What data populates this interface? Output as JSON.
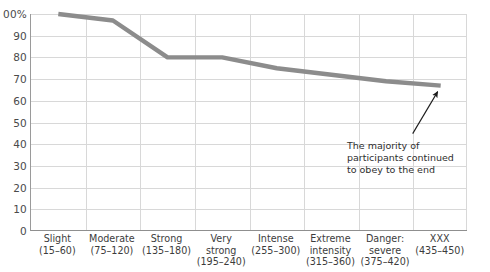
{
  "chart_data": {
    "type": "line",
    "title": "",
    "xlabel": "",
    "ylabel": "",
    "ylim": [
      0,
      100
    ],
    "grid": true,
    "legend": "none",
    "y_unit": "%",
    "y_ticks": [
      "100%",
      "90",
      "80",
      "70",
      "60",
      "50",
      "40",
      "30",
      "20",
      "10",
      "0"
    ],
    "y_tick_values": [
      100,
      90,
      80,
      70,
      60,
      50,
      40,
      30,
      20,
      10,
      0
    ],
    "y_top_label_clipped_text": "00%",
    "categories": [
      "Slight",
      "Moderate",
      "Strong",
      "Very strong",
      "Intense",
      "Extreme intensity",
      "Danger: severe",
      "XXX"
    ],
    "category_ranges": [
      "(15–60)",
      "(75–120)",
      "(135–180)",
      "(195–240)",
      "(255–300)",
      "(315–360)",
      "(375–420)",
      "(435–450)"
    ],
    "values": [
      100,
      97,
      80,
      80,
      75,
      72,
      69,
      67
    ],
    "series": [
      {
        "name": "Participants continuing to obey",
        "values": [
          100,
          97,
          80,
          80,
          75,
          72,
          69,
          67
        ],
        "color": "#8c8c8c"
      }
    ],
    "annotations": [
      {
        "lines": [
          "The majority of",
          "participants continued",
          "to obey to the end"
        ],
        "points_to_category": "XXX",
        "arrow": true
      }
    ]
  },
  "axis": {
    "line_color": "#8f8f8f",
    "grid_color": "#d8d8d8"
  },
  "x_labels": [
    {
      "name": "Slight",
      "range": "(15–60)"
    },
    {
      "name": "Moderate",
      "range": "(75–120)"
    },
    {
      "name": "Strong",
      "range": "(135–180)"
    },
    {
      "name": "Very\nstrong",
      "range": "(195–240)"
    },
    {
      "name": "Intense",
      "range": "(255–300)"
    },
    {
      "name": "Extreme\nintensity",
      "range": "(315–360)"
    },
    {
      "name": "Danger:\nsevere",
      "range": "(375–420)"
    },
    {
      "name": "XXX",
      "range": "(435–450)"
    }
  ]
}
